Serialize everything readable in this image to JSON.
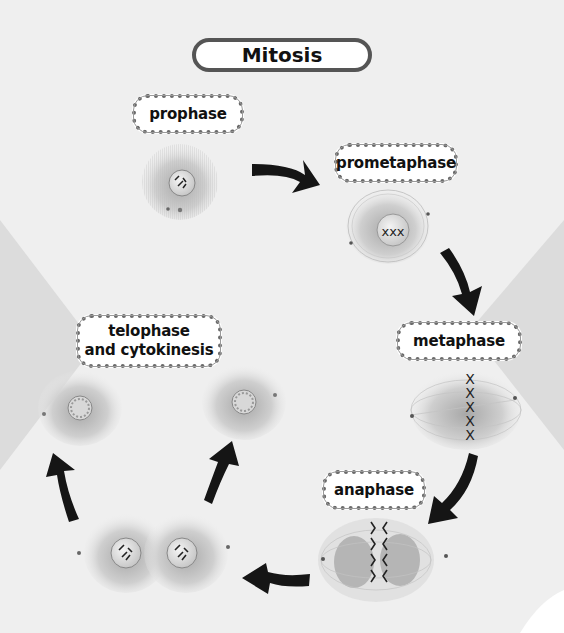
{
  "title": "Mitosis",
  "stages": [
    {
      "id": "prophase",
      "label": "prophase"
    },
    {
      "id": "prometaphase",
      "label": "prometaphase"
    },
    {
      "id": "metaphase",
      "label": "metaphase"
    },
    {
      "id": "anaphase",
      "label": "anaphase"
    },
    {
      "id": "telophase",
      "label_line1": "telophase",
      "label_line2": "and cytokinesis"
    }
  ],
  "cycle_order": [
    "prophase",
    "prometaphase",
    "metaphase",
    "anaphase",
    "telophase and cytokinesis"
  ],
  "colors": {
    "background": "#efefef",
    "side_shapes": "#d9d9d9",
    "arrow": "#151515",
    "cell": "#bdbdbd",
    "label_border": "#666666"
  }
}
